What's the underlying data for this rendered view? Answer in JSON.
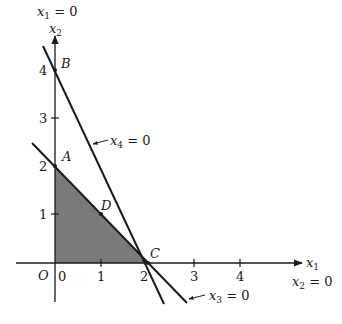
{
  "diagram": {
    "type": "linear-programming-feasible-region",
    "axes": {
      "x_label": "x",
      "x_sub": "1",
      "y_label": "x",
      "y_sub": "2",
      "x_ticks": [
        "0",
        "1",
        "2",
        "3",
        "4"
      ],
      "y_ticks": [
        "1",
        "2",
        "3",
        "4"
      ],
      "origin_label": "O",
      "x_axis_constraint": {
        "var": "x",
        "sub": "2",
        "rest": " = 0"
      },
      "y_axis_constraint": {
        "var": "x",
        "sub": "1",
        "rest": " = 0"
      }
    },
    "lines": [
      {
        "name": "x4-line",
        "var": "x",
        "sub": "4",
        "rest": " = 0",
        "from": [
          -0.25,
          4.5
        ],
        "to": [
          2.3,
          -0.9
        ]
      },
      {
        "name": "x3-line",
        "var": "x",
        "sub": "3",
        "rest": " = 0",
        "from": [
          -0.5,
          2.5
        ],
        "to": [
          2.8,
          -0.85
        ]
      }
    ],
    "points": [
      {
        "label": "A",
        "coords": [
          0,
          2
        ]
      },
      {
        "label": "B",
        "coords": [
          0,
          4
        ]
      },
      {
        "label": "C",
        "coords": [
          2,
          0
        ]
      },
      {
        "label": "D",
        "coords": [
          1,
          1
        ]
      }
    ],
    "feasible_region": {
      "vertices": [
        [
          0,
          0
        ],
        [
          0,
          2
        ],
        [
          2,
          0
        ]
      ],
      "fill": "#7a7a7a"
    },
    "colors": {
      "line": "#1a1a1a",
      "shade": "#7a7a7a",
      "background": "#ffffff"
    }
  }
}
